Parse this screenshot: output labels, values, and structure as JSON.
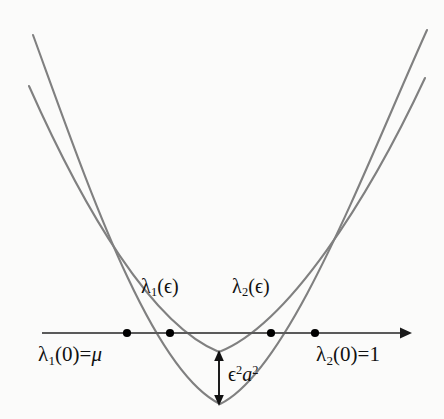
{
  "figure": {
    "type": "math-diagram",
    "background_color": "#fbfbfa",
    "curve_color": "#808080",
    "axis_color": "#5a5a5a",
    "text_color": "#111111",
    "marker_color": "#000000"
  },
  "axis": {
    "name": "horizontal-axis",
    "y": 333,
    "x_start": 42,
    "x_end": 410,
    "arrow": true
  },
  "curves": [
    {
      "name": "lambda-1-parabola",
      "label": "lambda_1(epsilon)",
      "roots": [
        170,
        271
      ],
      "vertex": [
        219,
        352
      ],
      "left_top": [
        29,
        86
      ],
      "right_top": [
        425,
        78
      ]
    },
    {
      "name": "lambda-2-parabola",
      "label": "lambda_2(epsilon)",
      "roots": [
        127,
        315
      ],
      "vertex": [
        220,
        404
      ],
      "left_top": [
        33,
        35
      ],
      "right_top": [
        427,
        30
      ]
    }
  ],
  "markers": [
    {
      "name": "root-lambda2-left",
      "x": 127,
      "y": 333
    },
    {
      "name": "root-lambda1-left",
      "x": 170,
      "y": 333
    },
    {
      "name": "root-lambda1-right",
      "x": 271,
      "y": 333
    },
    {
      "name": "root-lambda2-right",
      "x": 315,
      "y": 333
    }
  ],
  "gap_arrow": {
    "name": "gap-measure-arrow",
    "x": 219,
    "y_top": 353,
    "y_bottom": 403,
    "double_headed": true
  },
  "labels": {
    "curve_1": {
      "lambda": "λ",
      "subscript": "1",
      "argument": "(ϵ)"
    },
    "curve_2": {
      "lambda": "λ",
      "subscript": "2",
      "argument": "(ϵ)"
    },
    "root_1": {
      "lambda": "λ",
      "subscript": "1",
      "argument": "(0)",
      "equals": "=",
      "value": "μ"
    },
    "root_2": {
      "lambda": "λ",
      "subscript": "2",
      "argument": "(0)",
      "equals": "=",
      "value": "1"
    },
    "gap": {
      "epsilon": "ϵ",
      "epsilon_power": "2",
      "a": "a",
      "a_power": "2"
    }
  }
}
